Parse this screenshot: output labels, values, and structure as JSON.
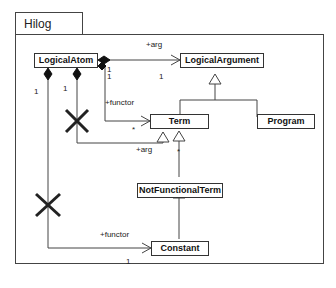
{
  "package": {
    "name": "Hilog"
  },
  "classes": {
    "logical_atom": "LogicalAtom",
    "logical_argument": "LogicalArgument",
    "term": "Term",
    "program": "Program",
    "not_functional_term": "NotFunctionalTerm",
    "constant": "Constant"
  },
  "labels": {
    "arg_top": "+arg",
    "arg_top_mult_source": "1",
    "arg_top_mult_target": "1",
    "functor_term": "+functor",
    "functor_term_mult_source": "1",
    "functor_term_mult_target": "*",
    "arg_term": "+arg",
    "arg_term_mult_source": "1",
    "arg_term_mult_target": "*",
    "functor_constant": "+functor",
    "functor_constant_mult_source": "1",
    "functor_constant_mult_target": "1"
  },
  "markers": {
    "removed_association_1": "X",
    "removed_association_2": "X"
  },
  "colors": {
    "line": "#444444",
    "cross": "#222222"
  }
}
